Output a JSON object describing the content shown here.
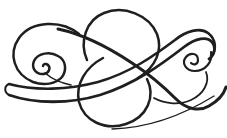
{
  "page": {
    "background_color": "#ffffff"
  },
  "ornament": {
    "name": "calligraphic-flourish",
    "kind": "decorative pen-flourish ornament",
    "ink_color": "#1f1f1f"
  }
}
